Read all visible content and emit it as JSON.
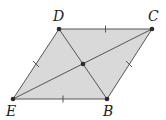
{
  "figure": {
    "type": "rhombus-with-diagonals",
    "colors": {
      "fill": "#d9d9d9",
      "stroke": "#555555",
      "point": "#2b2b2b",
      "label": "#222222"
    },
    "vertices": [
      {
        "name": "D",
        "x": 59,
        "y": 29,
        "label_x": 53,
        "label_y": 21
      },
      {
        "name": "C",
        "x": 152,
        "y": 29,
        "label_x": 148,
        "label_y": 21
      },
      {
        "name": "B",
        "x": 107,
        "y": 99,
        "label_x": 103,
        "label_y": 116
      },
      {
        "name": "E",
        "x": 13,
        "y": 99,
        "label_x": 6,
        "label_y": 116
      }
    ],
    "center": {
      "x": 83,
      "y": 64
    },
    "labels": {
      "D": "D",
      "C": "C",
      "B": "B",
      "E": "E"
    },
    "tick_marks": [
      "DC",
      "CB",
      "BE",
      "ED"
    ],
    "diagonals": [
      "EC",
      "DB"
    ]
  }
}
